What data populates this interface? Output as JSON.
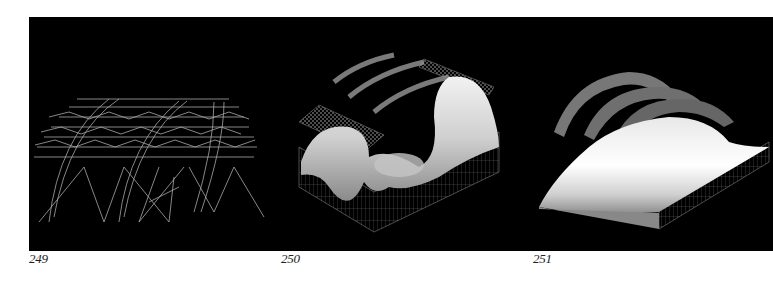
{
  "plate": {
    "background": "#000000",
    "figures": [
      {
        "number": "249",
        "subject": "space-frame-wireframe"
      },
      {
        "number": "250",
        "subject": "undulating-surface-with-roof-panels"
      },
      {
        "number": "251",
        "subject": "vaulted-surface-with-arched-panels"
      }
    ]
  },
  "captions": {
    "fig249": "249",
    "fig250": "250",
    "fig251": "251"
  }
}
